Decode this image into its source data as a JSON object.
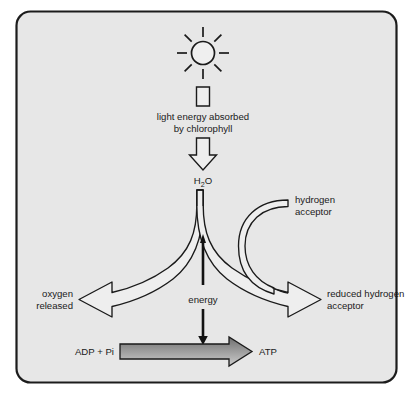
{
  "diagram": {
    "frame": {
      "border_color": "#1c1c1c",
      "fill_color": "#e7e7e7",
      "page_background": "#ffffff"
    },
    "colors": {
      "outline": "#1a1a1a",
      "arrow_fill_white": "#eeeeee",
      "arrow_fill_black": "#111111",
      "atp_arrow_top": "#6e6e6e",
      "atp_arrow_bottom": "#c9c9c9",
      "text": "#1a1a1a"
    },
    "icons": {
      "sun": "sun-icon",
      "sun_rays": 8
    },
    "labels": {
      "light_energy_line1": "light energy absorbed",
      "light_energy_line2": "by chlorophyll",
      "water": "H",
      "water_subscript": "2",
      "water_tail": "O",
      "hydrogen_acceptor_line1": "hydrogen",
      "hydrogen_acceptor_line2": "acceptor",
      "oxygen_released_line1": "oxygen",
      "oxygen_released_line2": "released",
      "reduced_acceptor_line1": "reduced hydrogen",
      "reduced_acceptor_line2": "acceptor",
      "energy": "energy",
      "adp_pi": "ADP + Pi",
      "atp": "ATP"
    }
  }
}
